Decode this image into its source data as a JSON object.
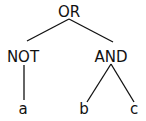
{
  "tree": {
    "root": {
      "label": "OR"
    },
    "left": {
      "label": "NOT",
      "child": {
        "label": "a"
      }
    },
    "right": {
      "label": "AND",
      "children": [
        {
          "label": "b"
        },
        {
          "label": "c"
        }
      ]
    }
  },
  "colors": {
    "stroke": "#111111",
    "background": "#ffffff"
  }
}
